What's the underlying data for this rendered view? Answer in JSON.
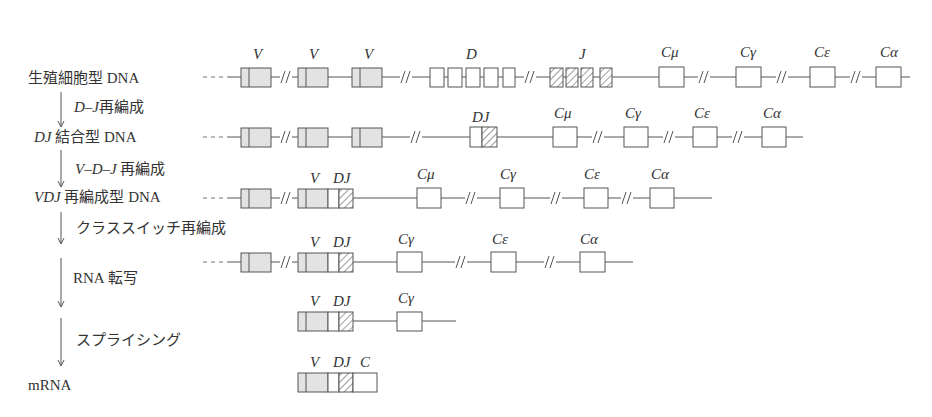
{
  "stages": [
    {
      "label": "生殖細胞型 DNA",
      "label_italic_prefix": ""
    },
    {
      "label": " 結合型 DNA",
      "label_italic_prefix": "DJ"
    },
    {
      "label": " 再編成型 DNA",
      "label_italic_prefix": "VDJ"
    },
    {
      "label": "",
      "label_italic_prefix": ""
    },
    {
      "label": "",
      "label_italic_prefix": ""
    },
    {
      "label": "mRNA",
      "label_italic_prefix": ""
    }
  ],
  "steps": [
    {
      "italic": "D–J",
      "text": "再編成"
    },
    {
      "italic": "V–D–J",
      "text": " 再編成"
    },
    {
      "italic": "",
      "text": "クラススイッチ再編成"
    },
    {
      "italic": "",
      "text": "RNA 転写"
    },
    {
      "italic": "",
      "text": "スプライシング"
    }
  ],
  "segment_labels": {
    "V": "V",
    "D": "D",
    "J": "J",
    "DJ": "DJ",
    "C": "C",
    "Cmu": "Cμ",
    "Cgamma": "Cγ",
    "Cepsilon": "Cε",
    "Calpha": "Cα"
  },
  "legend": {
    "V_fill": "#e3e3e3",
    "hatch_desc": "J / DJ segments hatched",
    "C_fill": "#ffffff"
  }
}
